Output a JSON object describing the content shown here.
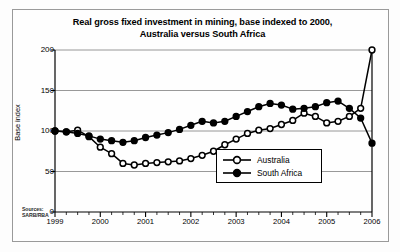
{
  "chart_data": {
    "type": "line",
    "title": "Real gross fixed investment in mining, base indexed to 2000, Australia versus South Africa",
    "title_line1": "Real gross fixed investment in mining, base indexed to 2000,",
    "title_line2": "Australia versus South Africa",
    "xlabel": "",
    "ylabel": "Base index",
    "ylim": [
      0,
      200
    ],
    "xlim": [
      1999,
      2006
    ],
    "yticks": [
      0,
      50,
      100,
      150,
      200
    ],
    "xticks": [
      "1999",
      "2000",
      "2001",
      "2002",
      "2003",
      "2004",
      "2005",
      "2006"
    ],
    "minor_ticks_per_year": 4,
    "grid": "horizontal",
    "legend_position": "center-right",
    "source": "Sources: SARB/RBA",
    "source_line1": "Sources:",
    "source_line2": "SARB/RBA",
    "x": [
      1999.0,
      1999.25,
      1999.5,
      1999.75,
      2000.0,
      2000.25,
      2000.5,
      2000.75,
      2001.0,
      2001.25,
      2001.5,
      2001.75,
      2002.0,
      2002.25,
      2002.5,
      2002.75,
      2003.0,
      2003.25,
      2003.5,
      2003.75,
      2004.0,
      2004.25,
      2004.5,
      2004.75,
      2005.0,
      2005.25,
      2005.5,
      2005.75,
      2006.0
    ],
    "series": [
      {
        "name": "Australia",
        "marker": "open-circle",
        "color": "#000000",
        "values": [
          100,
          99,
          101,
          93,
          80,
          72,
          60,
          58,
          60,
          61,
          62,
          63,
          66,
          70,
          75,
          83,
          90,
          97,
          101,
          103,
          108,
          113,
          122,
          118,
          110,
          112,
          118,
          128,
          200
        ]
      },
      {
        "name": "South Africa",
        "marker": "filled-circle",
        "color": "#000000",
        "values": [
          100,
          99,
          97,
          94,
          90,
          88,
          86,
          88,
          92,
          95,
          98,
          102,
          107,
          112,
          110,
          112,
          118,
          124,
          130,
          134,
          132,
          127,
          128,
          130,
          135,
          137,
          128,
          116,
          85
        ]
      }
    ],
    "series_detail": [
      {
        "name": "Australia",
        "points": [
          {
            "x": 1999.0,
            "y": 100
          },
          {
            "x": 1999.25,
            "y": 99
          },
          {
            "x": 1999.5,
            "y": 101
          },
          {
            "x": 1999.75,
            "y": 93
          },
          {
            "x": 2000.0,
            "y": 80
          },
          {
            "x": 2000.25,
            "y": 72
          },
          {
            "x": 2000.5,
            "y": 60
          },
          {
            "x": 2000.75,
            "y": 58
          },
          {
            "x": 2001.0,
            "y": 60
          },
          {
            "x": 2001.25,
            "y": 61
          },
          {
            "x": 2001.5,
            "y": 62
          },
          {
            "x": 2001.75,
            "y": 63
          },
          {
            "x": 2002.0,
            "y": 66
          },
          {
            "x": 2002.25,
            "y": 70
          },
          {
            "x": 2002.5,
            "y": 75
          },
          {
            "x": 2002.75,
            "y": 83
          },
          {
            "x": 2003.0,
            "y": 90
          },
          {
            "x": 2003.25,
            "y": 97
          },
          {
            "x": 2003.5,
            "y": 101
          },
          {
            "x": 2003.75,
            "y": 103
          },
          {
            "x": 2004.0,
            "y": 108
          },
          {
            "x": 2004.25,
            "y": 113
          },
          {
            "x": 2004.5,
            "y": 122
          },
          {
            "x": 2004.75,
            "y": 118
          },
          {
            "x": 2005.0,
            "y": 110
          },
          {
            "x": 2005.25,
            "y": 112
          },
          {
            "x": 2005.5,
            "y": 118
          },
          {
            "x": 2005.75,
            "y": 128
          },
          {
            "x": 2006.0,
            "y": 200
          }
        ]
      },
      {
        "name": "South Africa",
        "points": [
          {
            "x": 1999.0,
            "y": 100
          },
          {
            "x": 1999.25,
            "y": 99
          },
          {
            "x": 1999.5,
            "y": 97
          },
          {
            "x": 1999.75,
            "y": 94
          },
          {
            "x": 2000.0,
            "y": 90
          },
          {
            "x": 2000.25,
            "y": 88
          },
          {
            "x": 2000.5,
            "y": 86
          },
          {
            "x": 2000.75,
            "y": 88
          },
          {
            "x": 2001.0,
            "y": 92
          },
          {
            "x": 2001.25,
            "y": 95
          },
          {
            "x": 2001.5,
            "y": 98
          },
          {
            "x": 2001.75,
            "y": 102
          },
          {
            "x": 2002.0,
            "y": 107
          },
          {
            "x": 2002.25,
            "y": 112
          },
          {
            "x": 2002.5,
            "y": 110
          },
          {
            "x": 2002.75,
            "y": 112
          },
          {
            "x": 2003.0,
            "y": 118
          },
          {
            "x": 2003.25,
            "y": 124
          },
          {
            "x": 2003.5,
            "y": 130
          },
          {
            "x": 2003.75,
            "y": 134
          },
          {
            "x": 2004.0,
            "y": 132
          },
          {
            "x": 2004.25,
            "y": 127
          },
          {
            "x": 2004.5,
            "y": 128
          },
          {
            "x": 2004.75,
            "y": 130
          },
          {
            "x": 2005.0,
            "y": 135
          },
          {
            "x": 2005.25,
            "y": 137
          },
          {
            "x": 2005.5,
            "y": 128
          },
          {
            "x": 2005.75,
            "y": 116
          },
          {
            "x": 2006.0,
            "y": 85
          }
        ]
      }
    ]
  },
  "legend": {
    "items": [
      {
        "label": "Australia",
        "marker": "open-circle"
      },
      {
        "label": "South Africa",
        "marker": "filled-circle"
      }
    ]
  }
}
